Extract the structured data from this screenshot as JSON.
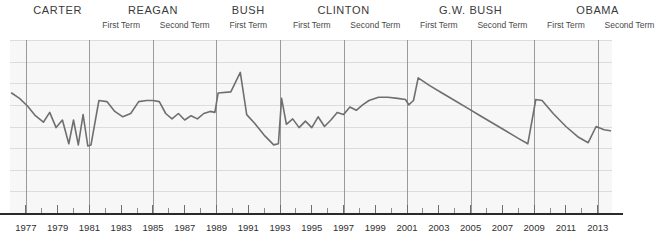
{
  "chart_data": {
    "type": "line",
    "title": "",
    "subtitle": "",
    "xlabel": "",
    "ylabel": "",
    "grid": true,
    "legend_position": "none",
    "xlim": [
      1976.0,
      2013.9
    ],
    "ylim": [
      0,
      8
    ],
    "xtick_step": 1,
    "xtick_labels": [
      "1977",
      "1979",
      "1981",
      "1983",
      "1985",
      "1987",
      "1989",
      "1991",
      "1993",
      "1995",
      "1997",
      "1999",
      "2001",
      "2003",
      "2005",
      "2007",
      "2009",
      "2011",
      "2013"
    ],
    "gridline_count": 8,
    "line_color": "#6f6f6f",
    "series": [
      {
        "name": "series-1",
        "x": [
          1976.1,
          1976.6,
          1977.1,
          1977.6,
          1978.1,
          1978.5,
          1978.9,
          1979.3,
          1979.7,
          1980.0,
          1980.3,
          1980.6,
          1980.9,
          1981.1,
          1981.6,
          1982.1,
          1982.6,
          1983.1,
          1983.6,
          1984.1,
          1984.6,
          1985.0,
          1985.4,
          1985.8,
          1986.2,
          1986.6,
          1987.0,
          1987.4,
          1987.8,
          1988.2,
          1988.6,
          1988.9,
          1989.1,
          1989.9,
          1990.5,
          1990.9,
          1991.4,
          1992.0,
          1992.6,
          1992.9,
          1993.1,
          1993.4,
          1993.8,
          1994.2,
          1994.6,
          1995.0,
          1995.4,
          1995.8,
          1996.2,
          1996.6,
          1997.0,
          1997.4,
          1997.8,
          1998.2,
          1998.6,
          1999.2,
          1999.8,
          2000.4,
          2000.9,
          2001.1,
          2001.4,
          2001.7,
          2002.4,
          2003.2,
          2004.0,
          2004.8,
          2005.6,
          2006.4,
          2007.2,
          2008.0,
          2008.6,
          2009.1,
          2009.5,
          2010.2,
          2011.0,
          2011.8,
          2012.4,
          2012.9,
          2013.4,
          2013.8
        ],
        "values": [
          5.55,
          5.3,
          4.95,
          4.5,
          4.2,
          4.65,
          3.95,
          4.3,
          3.2,
          4.3,
          3.15,
          4.55,
          3.1,
          3.15,
          5.2,
          5.15,
          4.7,
          4.45,
          4.6,
          5.15,
          5.2,
          5.2,
          5.15,
          4.6,
          4.35,
          4.6,
          4.3,
          4.5,
          4.35,
          4.6,
          4.7,
          4.65,
          5.55,
          5.6,
          6.5,
          4.55,
          4.15,
          3.6,
          3.15,
          3.2,
          5.3,
          4.1,
          4.35,
          3.95,
          4.25,
          3.95,
          4.45,
          4.0,
          4.3,
          4.65,
          4.55,
          4.9,
          4.75,
          5.0,
          5.2,
          5.35,
          5.35,
          5.3,
          5.25,
          5.0,
          5.2,
          6.25,
          5.9,
          5.55,
          5.2,
          4.85,
          4.5,
          4.15,
          3.8,
          3.45,
          3.2,
          5.25,
          5.2,
          4.6,
          4.0,
          3.5,
          3.25,
          4.0,
          3.85,
          3.8
        ]
      }
    ]
  },
  "header": {
    "administrations": [
      {
        "name": "CARTER",
        "start_year": 1977,
        "terms": [
          "First Term"
        ],
        "show_term_labels": false
      },
      {
        "name": "REAGAN",
        "start_year": 1981,
        "terms": [
          "First Term",
          "Second Term"
        ],
        "show_term_labels": true
      },
      {
        "name": "BUSH",
        "start_year": 1989,
        "terms": [
          "First Term"
        ],
        "show_term_labels": false
      },
      {
        "name": "CLINTON",
        "start_year": 1993,
        "terms": [
          "First Term",
          "Second Term"
        ],
        "show_term_labels": true
      },
      {
        "name": "G.W. BUSH",
        "start_year": 2001,
        "terms": [
          "First Term",
          "Second Term"
        ],
        "show_term_labels": true
      },
      {
        "name": "OBAMA",
        "start_year": 2009,
        "terms": [
          "First Term",
          "Second Term"
        ],
        "show_term_labels": true
      }
    ],
    "bush_first_term_label": "First Term",
    "clinton_second_term_label": "Second Term"
  },
  "axis": {
    "first_year": 1977,
    "last_year": 2013,
    "label_step": 2
  },
  "colors": {
    "plot_background": "#f7f7f7",
    "gridline": "#d8dde3",
    "divider": "#8a8a8a",
    "line": "#6f6f6f",
    "axis": "#2a2a2a",
    "text": "#3a3a3a"
  }
}
